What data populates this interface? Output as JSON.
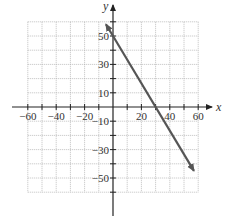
{
  "chart_data": {
    "type": "line",
    "title": "",
    "xlabel": "x",
    "ylabel": "y",
    "xlim": [
      -60,
      60
    ],
    "ylim": [
      -60,
      60
    ],
    "grid": true,
    "grid_step": 10,
    "x_tick_labels": [
      "-60",
      "-40",
      "-20",
      "20",
      "40",
      "60"
    ],
    "x_tick_values": [
      -60,
      -40,
      -20,
      20,
      40,
      60
    ],
    "y_tick_labels": [
      "50",
      "30",
      "10",
      "-10",
      "-30",
      "-50"
    ],
    "y_tick_values": [
      50,
      30,
      10,
      -10,
      -30,
      -50
    ],
    "series": [
      {
        "name": "line",
        "equation": "y = -5/3 x + 50",
        "x": [
          -5,
          0,
          30,
          57
        ],
        "y": [
          58.3,
          50,
          0,
          -45
        ],
        "arrows": "both",
        "color": "#555555"
      }
    ]
  },
  "colors": {
    "grid": "#b0b0b0",
    "axis": "#222222",
    "line": "#555555"
  }
}
